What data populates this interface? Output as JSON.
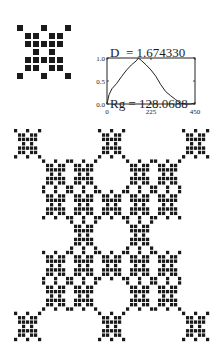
{
  "equations": {
    "dimension": "D  = 1.674330",
    "radius_of_gyration": "Rg = 128.0688"
  },
  "generator": {
    "size": 7,
    "rows": [
      [
        1,
        0,
        0,
        1,
        0,
        0,
        1
      ],
      [
        0,
        1,
        1,
        0,
        1,
        1,
        0
      ],
      [
        0,
        1,
        1,
        1,
        1,
        1,
        0
      ],
      [
        0,
        0,
        1,
        0,
        1,
        0,
        0
      ],
      [
        0,
        1,
        1,
        1,
        1,
        1,
        0
      ],
      [
        0,
        1,
        1,
        0,
        1,
        1,
        0
      ],
      [
        1,
        0,
        0,
        1,
        0,
        0,
        1
      ]
    ],
    "color": "#1a1a1a"
  },
  "fractal": {
    "level": 2,
    "color": "#1a1a1a"
  },
  "chart_data": {
    "type": "line",
    "title": "",
    "xlabel": "",
    "ylabel": "",
    "xlim": [
      0,
      450
    ],
    "ylim": [
      0.0,
      1.0
    ],
    "x_ticks": [
      "0",
      "225",
      "450"
    ],
    "y_ticks": [
      "0.0",
      "0.5",
      "1.0"
    ],
    "grid": false,
    "legend": null,
    "x": [
      0,
      10,
      25,
      50,
      75,
      100,
      125,
      150,
      160,
      175,
      200,
      225,
      250,
      275,
      300,
      325,
      350,
      375,
      400,
      425,
      450
    ],
    "values": [
      0.0,
      0.2,
      0.33,
      0.45,
      0.6,
      0.74,
      0.85,
      0.94,
      1.0,
      0.95,
      0.85,
      0.74,
      0.6,
      0.42,
      0.27,
      0.18,
      0.1,
      0.02,
      0.0,
      0.0,
      0.02
    ]
  }
}
